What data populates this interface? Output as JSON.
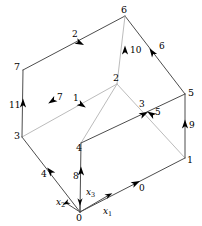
{
  "figure": {
    "background": "#ffffff",
    "width": 202,
    "height": 226,
    "colors": {
      "front_edge": "#4d4d4d",
      "back_edge": "#b3b3b3",
      "arrow": "#000000",
      "text": "#000000"
    }
  },
  "vertices": [
    {
      "label": "0",
      "x": 80,
      "y": 212,
      "text_x": 76,
      "text_y": 213
    },
    {
      "label": "1",
      "x": 185,
      "y": 158,
      "text_x": 187,
      "text_y": 155
    },
    {
      "label": "2",
      "x": 117,
      "y": 84,
      "text_x": 113,
      "text_y": 73
    },
    {
      "label": "3",
      "x": 22,
      "y": 137,
      "text_x": 14,
      "text_y": 131
    },
    {
      "label": "4",
      "x": 81,
      "y": 143,
      "text_x": 76,
      "text_y": 143
    },
    {
      "label": "5",
      "x": 185,
      "y": 94,
      "text_x": 188,
      "text_y": 88
    },
    {
      "label": "6",
      "x": 125,
      "y": 16,
      "text_x": 121,
      "text_y": 5
    },
    {
      "label": "7",
      "x": 23,
      "y": 70,
      "text_x": 14,
      "text_y": 62
    }
  ],
  "edges": [
    {
      "label": "0",
      "from": "0",
      "to": "1",
      "hidden": false,
      "label_x": 139,
      "label_y": 184,
      "arrow_x": 136,
      "arrow_y": 183,
      "angle": -27
    },
    {
      "label": "1",
      "from": "4",
      "to": "2",
      "hidden": true,
      "label_x": 73,
      "label_y": 94,
      "arrow_x": 82,
      "arrow_y": 105,
      "angle": 32
    },
    {
      "label": "2",
      "from": "7",
      "to": "6",
      "hidden": false,
      "label_x": 72,
      "label_y": 30,
      "arrow_x": 80,
      "arrow_y": 43,
      "angle": 27
    },
    {
      "label": "3",
      "from": "4",
      "to": "5",
      "hidden": false,
      "label_x": 139,
      "label_y": 100,
      "arrow_x": 144,
      "arrow_y": 114,
      "angle": -27
    },
    {
      "label": "4",
      "from": "0",
      "to": "3",
      "hidden": false,
      "label_x": 41,
      "label_y": 170,
      "arrow_x": 50,
      "arrow_y": 171,
      "angle": -130
    },
    {
      "label": "5",
      "from": "1",
      "to": "2",
      "hidden": true,
      "label_x": 155,
      "label_y": 108,
      "arrow_x": 151,
      "arrow_y": 114,
      "angle": -148
    },
    {
      "label": "6",
      "from": "5",
      "to": "6",
      "hidden": false,
      "label_x": 159,
      "label_y": 42,
      "arrow_x": 152,
      "arrow_y": 52,
      "angle": -125
    },
    {
      "label": "7",
      "from": "2",
      "to": "3",
      "hidden": true,
      "label_x": 57,
      "label_y": 93,
      "arrow_x": 52,
      "arrow_y": 101,
      "angle": 148
    },
    {
      "label": "8",
      "from": "0",
      "to": "4",
      "hidden": false,
      "label_x": 73,
      "label_y": 172,
      "arrow_x": 81,
      "arrow_y": 171,
      "angle": -90
    },
    {
      "label": "9",
      "from": "1",
      "to": "5",
      "hidden": false,
      "label_x": 189,
      "label_y": 121,
      "arrow_x": 185,
      "arrow_y": 124,
      "angle": -90
    },
    {
      "label": "10",
      "from": "2",
      "to": "6",
      "hidden": true,
      "label_x": 130,
      "label_y": 46,
      "arrow_x": 125,
      "arrow_y": 50,
      "angle": -90
    },
    {
      "label": "11",
      "from": "3",
      "to": "7",
      "hidden": false,
      "label_x": 9,
      "label_y": 101,
      "arrow_x": 23,
      "arrow_y": 103,
      "angle": -90
    }
  ],
  "axes": [
    {
      "label": "x",
      "sub": "1",
      "text_x": 103,
      "text_y": 207,
      "tip_x": 109,
      "tip_y": 195,
      "angle": -27
    },
    {
      "label": "x",
      "sub": "2",
      "text_x": 56,
      "text_y": 198,
      "tip_x": 66,
      "tip_y": 203,
      "angle": 153
    },
    {
      "label": "x",
      "sub": "3",
      "text_x": 86,
      "text_y": 188,
      "tip_x": 80,
      "tip_y": 202,
      "angle": 90
    }
  ]
}
